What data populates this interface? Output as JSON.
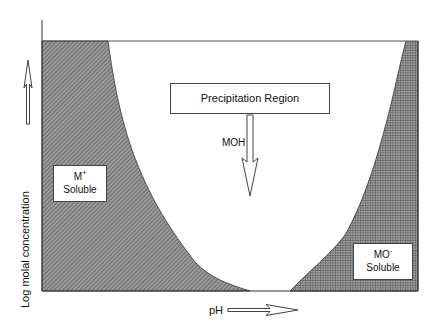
{
  "diagram": {
    "type": "solubility-phase-diagram",
    "axes": {
      "x_label": "pH",
      "y_label": "Log molal concentration"
    },
    "regions": {
      "center": {
        "label": "Precipitation Region"
      },
      "left": {
        "species": "M",
        "charge": "+",
        "state": "Soluble"
      },
      "right": {
        "species": "MO",
        "charge": "-",
        "state": "Soluble"
      }
    },
    "arrow_label": "MOH",
    "colors": {
      "left_fill": "#8a8a8a",
      "right_fill": "#7a7a7a",
      "line": "#333333",
      "background": "#ffffff"
    }
  }
}
